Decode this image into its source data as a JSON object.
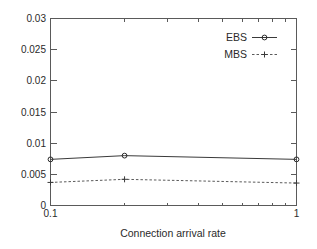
{
  "chart_data": {
    "type": "line",
    "title": "",
    "xlabel": "Connection arrival rate",
    "ylabel": "",
    "xscale": "log",
    "yscale": "linear",
    "xlim": [
      0.1,
      1
    ],
    "ylim": [
      0,
      0.03
    ],
    "grid": false,
    "legend_position": "top-right",
    "x": [
      0.1,
      0.2,
      1.0
    ],
    "xticks": [
      "0.1",
      "1"
    ],
    "xtick_values": [
      0.1,
      1
    ],
    "yticks": [
      "0",
      "0.005",
      "0.01",
      "0.015",
      "0.02",
      "0.025",
      "0.03"
    ],
    "ytick_values": [
      0,
      0.005,
      0.01,
      0.015,
      0.02,
      0.025,
      0.03
    ],
    "series": [
      {
        "name": "EBS",
        "values": [
          0.0074,
          0.008,
          0.0074
        ],
        "linestyle": "solid",
        "marker": "circle",
        "color": "#2a2a2a"
      },
      {
        "name": "MBS",
        "values": [
          0.0037,
          0.0042,
          0.0036
        ],
        "linestyle": "dashed",
        "marker": "plus",
        "color": "#5a5a5a"
      }
    ]
  },
  "legend": {
    "entries": [
      {
        "label": "EBS"
      },
      {
        "label": "MBS"
      }
    ]
  },
  "axes": {
    "x_title": "Connection arrival rate",
    "x_tick_labels": [
      "0.1",
      "1"
    ],
    "y_tick_labels": [
      "0",
      "0.005",
      "0.01",
      "0.015",
      "0.02",
      "0.025",
      "0.03"
    ]
  },
  "colors": {
    "background": "#ffffff",
    "frame": "#5a5a5a",
    "ebs": "#2a2a2a",
    "mbs": "#5a5a5a",
    "text": "#2a2a2a"
  }
}
